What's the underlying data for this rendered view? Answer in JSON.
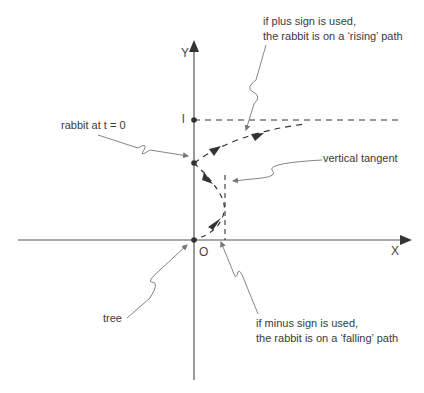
{
  "axes": {
    "x_label": "X",
    "y_label": "Y",
    "origin_label": "O",
    "tick_label": "l"
  },
  "annotations": {
    "rising": [
      "if plus sign is used,",
      "the rabbit is on a ‘rising’ path"
    ],
    "start": "rabbit at t = 0",
    "vertical_tangent": "vertical tangent",
    "tree": "tree",
    "falling": [
      "if minus sign is used,",
      "the rabbit is on a ‘falling’ path"
    ]
  },
  "colors": {
    "axis": "#555555",
    "curve": "#333333",
    "leader": "#777777",
    "text": "#3a3a3a"
  }
}
